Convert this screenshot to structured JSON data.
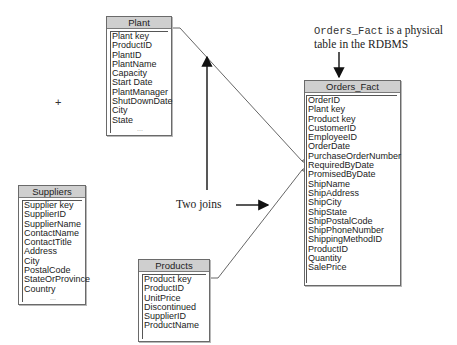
{
  "tables": {
    "plant": {
      "title": "Plant",
      "fields": [
        "Plant key",
        "ProductID",
        "PlantID",
        "PlantName",
        "Capacity",
        "Start Date",
        "PlantManager",
        "ShutDownDate",
        "City",
        "State"
      ],
      "more": "..."
    },
    "orders_fact": {
      "title": "Orders_Fact",
      "fields": [
        "OrderID",
        "Plant key",
        "Product key",
        "CustomerID",
        "EmployeeID",
        "OrderDate",
        "PurchaseOrderNumber",
        "RequiredByDate",
        "PromisedByDate",
        "ShipName",
        "ShipAddress",
        "ShipCity",
        "ShipState",
        "ShipPostalCode",
        "ShipPhoneNumber",
        "ShippingMethodID",
        "ProductID",
        "Quantity",
        "SalePrice"
      ]
    },
    "suppliers": {
      "title": "Suppliers",
      "fields": [
        "Supplier key",
        "SupplierID",
        "SupplierName",
        "ContactName",
        "ContactTitle",
        "Address",
        "City",
        "PostalCode",
        "StateOrProvince",
        "Country"
      ],
      "more": "..."
    },
    "products": {
      "title": "Products",
      "fields": [
        "Product key",
        "ProductID",
        "UnitPrice",
        "Discontinued",
        "SupplierID",
        "ProductName"
      ]
    }
  },
  "annotations": {
    "physical_code": "Orders_Fact",
    "physical_rest": " is a physical",
    "physical_line2": "table in the RDBMS",
    "two_joins": "Two joins"
  },
  "cursor": "+"
}
